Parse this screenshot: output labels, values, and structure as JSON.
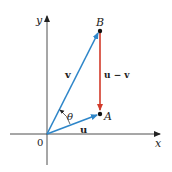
{
  "diagram": {
    "axes": {
      "x_label": "x",
      "y_label": "y",
      "origin_label": "0"
    },
    "points": {
      "A": "A",
      "B": "B"
    },
    "vectors": {
      "u": {
        "label": "u",
        "color": "#2e86c9"
      },
      "v": {
        "label": "v",
        "color": "#2e86c9"
      },
      "u_minus_v": {
        "label": "u − v",
        "color": "#d23a2a"
      }
    },
    "angle_label": "θ"
  }
}
